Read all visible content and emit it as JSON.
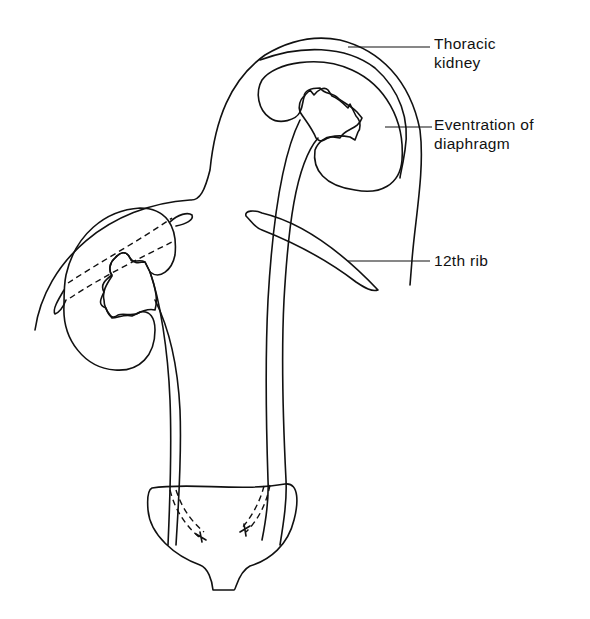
{
  "figure": {
    "labels": {
      "thoracic_kidney": "Thoracic\nkidney",
      "eventration": "Eventration of\ndiaphragm",
      "rib": "12th rib"
    },
    "colors": {
      "ink": "#111111",
      "background": "#ffffff",
      "hatch": "#555555",
      "stipple": "#777777"
    }
  }
}
